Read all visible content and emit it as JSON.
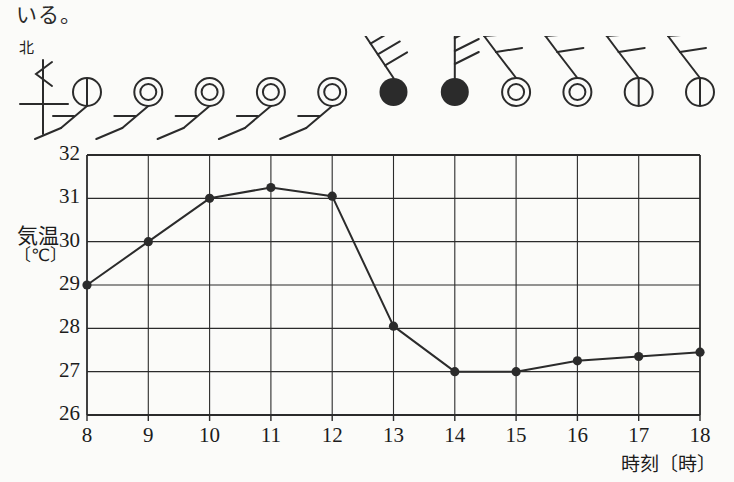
{
  "page": {
    "top_text": "いる。",
    "background_color": "#fbfbf9",
    "ink_color": "#2b2b2b"
  },
  "compass": {
    "label": "北",
    "icon_name": "north-arrow-icon"
  },
  "axis": {
    "y_label_kanji": "気温",
    "y_label_unit": "〔℃〕",
    "x_label": "時刻〔時〕",
    "y_ticks": [
      "32",
      "31",
      "30",
      "29",
      "28",
      "27",
      "26"
    ],
    "x_ticks": [
      "8",
      "9",
      "10",
      "11",
      "12",
      "13",
      "14",
      "15",
      "16",
      "17",
      "18"
    ]
  },
  "chart_data": {
    "type": "line",
    "title": "",
    "xlabel": "時刻〔時〕",
    "ylabel": "気温〔℃〕",
    "xlim": [
      8,
      18
    ],
    "ylim": [
      26,
      32
    ],
    "grid": true,
    "legend": "none",
    "x": [
      8,
      9,
      10,
      11,
      12,
      13,
      14,
      15,
      16,
      17,
      18
    ],
    "values": [
      29.0,
      30.0,
      31.0,
      31.25,
      31.05,
      28.05,
      27.0,
      27.0,
      27.25,
      27.35,
      27.45
    ],
    "categories": [
      "8",
      "9",
      "10",
      "11",
      "12",
      "13",
      "14",
      "15",
      "16",
      "17",
      "18"
    ],
    "marker": "filled-circle",
    "line_color": "#2b2b2b"
  },
  "weather_symbols": [
    {
      "hour": "8",
      "sky": "partly-cloudy",
      "sky_glyph": "circle-with-vertical-bar",
      "wind_dir": "south-west",
      "wind_barbs": 1,
      "barb_style": "down-left"
    },
    {
      "hour": "9",
      "sky": "cloudy",
      "sky_glyph": "double-circle",
      "wind_dir": "south-west",
      "wind_barbs": 1,
      "barb_style": "down-left"
    },
    {
      "hour": "10",
      "sky": "cloudy",
      "sky_glyph": "double-circle",
      "wind_dir": "south-west",
      "wind_barbs": 1,
      "barb_style": "down-left"
    },
    {
      "hour": "11",
      "sky": "cloudy",
      "sky_glyph": "double-circle",
      "wind_dir": "south-west",
      "wind_barbs": 1,
      "barb_style": "down-left"
    },
    {
      "hour": "12",
      "sky": "cloudy",
      "sky_glyph": "double-circle",
      "wind_dir": "south-west",
      "wind_barbs": 1,
      "barb_style": "down-left"
    },
    {
      "hour": "13",
      "sky": "rain",
      "sky_glyph": "filled-circle",
      "wind_dir": "north-west",
      "wind_barbs": 3,
      "barb_style": "up-left-tilted"
    },
    {
      "hour": "14",
      "sky": "rain",
      "sky_glyph": "filled-circle",
      "wind_dir": "north",
      "wind_barbs": 3,
      "barb_style": "up-straight"
    },
    {
      "hour": "15",
      "sky": "cloudy",
      "sky_glyph": "double-circle",
      "wind_dir": "north-east",
      "wind_barbs": 2,
      "barb_style": "up-left-bent"
    },
    {
      "hour": "16",
      "sky": "cloudy",
      "sky_glyph": "double-circle",
      "wind_dir": "north-east",
      "wind_barbs": 2,
      "barb_style": "up-left-bent"
    },
    {
      "hour": "17",
      "sky": "partly-cloudy",
      "sky_glyph": "circle-with-vertical-bar",
      "wind_dir": "north-east",
      "wind_barbs": 2,
      "barb_style": "up-left-bent"
    },
    {
      "hour": "18",
      "sky": "partly-cloudy",
      "sky_glyph": "circle-with-vertical-bar",
      "wind_dir": "north-east",
      "wind_barbs": 2,
      "barb_style": "up-left-bent"
    }
  ]
}
